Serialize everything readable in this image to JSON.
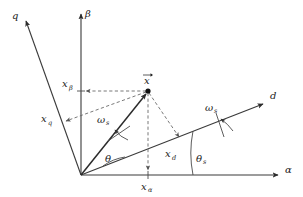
{
  "figure": {
    "background_color": "#ffffff",
    "line_color": "#3a3a3a",
    "dash_color": "#6a6a6a",
    "vector_color": "#2b2b2b"
  },
  "axes": [
    {
      "id": "alpha",
      "label": "α",
      "label_x": 287,
      "label_y": 173,
      "from": [
        81,
        175
      ],
      "to": [
        281,
        175
      ],
      "kind": "stationary-horizontal"
    },
    {
      "id": "beta",
      "label": "β",
      "label_x": 87,
      "label_y": 15,
      "from": [
        81,
        175
      ],
      "to": [
        81,
        11
      ],
      "kind": "stationary-vertical"
    },
    {
      "id": "d",
      "label": "d",
      "label_x": 272,
      "label_y": 99,
      "from": [
        81,
        175
      ],
      "to": [
        266,
        103
      ],
      "kind": "rotating-direct"
    },
    {
      "id": "q",
      "label": "q",
      "label_x": 14,
      "label_y": 17,
      "from": [
        81,
        175
      ],
      "to": [
        23,
        19
      ],
      "kind": "rotating-quadrature"
    }
  ],
  "vector": {
    "name": "x-vector",
    "label": "x",
    "label_accent": "→",
    "label_x": 147,
    "label_y": 80,
    "tip": [
      148,
      91
    ],
    "origin": [
      81,
      175
    ]
  },
  "projections": [
    {
      "id": "x-beta",
      "base": "x",
      "sub": "β",
      "label_x": 63,
      "label_y": 86,
      "axis": "beta",
      "foot": [
        81,
        91
      ]
    },
    {
      "id": "x-alpha",
      "base": "x",
      "sub": "α",
      "label_x": 142,
      "label_y": 190,
      "axis": "alpha",
      "foot": [
        148,
        175
      ]
    },
    {
      "id": "x-d",
      "base": "x",
      "sub": "d",
      "label_x": 166,
      "label_y": 158,
      "axis": "d",
      "foot": [
        181,
        141
      ]
    },
    {
      "id": "x-q",
      "base": "x",
      "sub": "q",
      "label_x": 40,
      "label_y": 124,
      "axis": "q",
      "foot": [
        62,
        122
      ]
    }
  ],
  "angles": [
    {
      "id": "theta",
      "label": "θ",
      "sub": "",
      "label_x": 106,
      "label_y": 161,
      "between": [
        "d-axis",
        "x-vector"
      ]
    },
    {
      "id": "theta-s",
      "label": "θ",
      "sub": "s",
      "label_x": 198,
      "label_y": 162,
      "between": [
        "alpha-axis",
        "d-axis"
      ]
    }
  ],
  "angular_speeds": [
    {
      "id": "omega-s-vector",
      "base": "ω",
      "sub": "s",
      "label_x": 98,
      "label_y": 122,
      "on": "x-vector"
    },
    {
      "id": "omega-s-daxis",
      "base": "ω",
      "sub": "s",
      "label_x": 206,
      "label_y": 110,
      "on": "d-axis"
    }
  ]
}
